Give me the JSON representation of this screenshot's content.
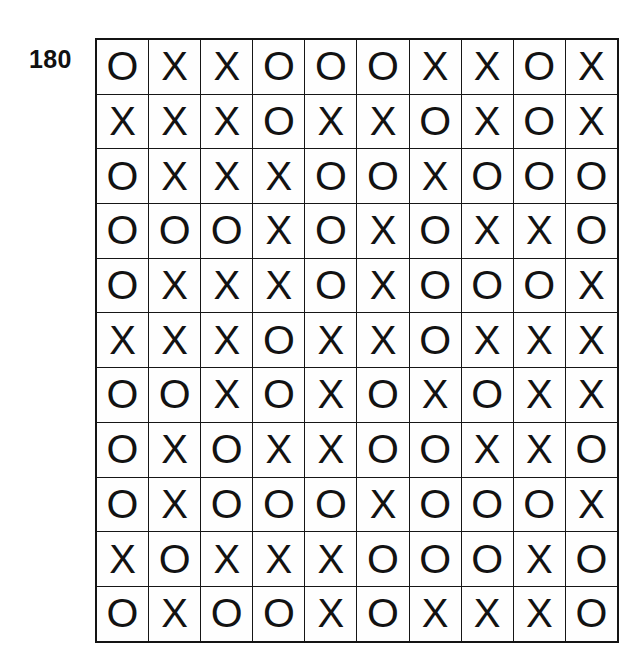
{
  "figure": {
    "label": "180",
    "background_color": "#ffffff",
    "ink_color": "#121212"
  },
  "grid": {
    "rows": 11,
    "columns": 10,
    "border_color": "#141414",
    "cell_background": "#fefefe",
    "cells": [
      [
        "O",
        "X",
        "X",
        "O",
        "O",
        "O",
        "X",
        "X",
        "O",
        "X"
      ],
      [
        "X",
        "X",
        "X",
        "O",
        "X",
        "X",
        "O",
        "X",
        "O",
        "X"
      ],
      [
        "O",
        "X",
        "X",
        "X",
        "O",
        "O",
        "X",
        "O",
        "O",
        "O"
      ],
      [
        "O",
        "O",
        "O",
        "X",
        "O",
        "X",
        "O",
        "X",
        "X",
        "O"
      ],
      [
        "O",
        "X",
        "X",
        "X",
        "O",
        "X",
        "O",
        "O",
        "O",
        "X"
      ],
      [
        "X",
        "X",
        "X",
        "O",
        "X",
        "X",
        "O",
        "X",
        "X",
        "X"
      ],
      [
        "O",
        "O",
        "X",
        "O",
        "X",
        "O",
        "X",
        "O",
        "X",
        "X"
      ],
      [
        "O",
        "X",
        "O",
        "X",
        "X",
        "O",
        "O",
        "X",
        "X",
        "O"
      ],
      [
        "O",
        "X",
        "O",
        "O",
        "O",
        "X",
        "O",
        "O",
        "O",
        "X"
      ],
      [
        "X",
        "O",
        "X",
        "X",
        "X",
        "O",
        "O",
        "O",
        "X",
        "O"
      ],
      [
        "O",
        "X",
        "O",
        "O",
        "X",
        "O",
        "X",
        "X",
        "X",
        "O"
      ]
    ]
  }
}
